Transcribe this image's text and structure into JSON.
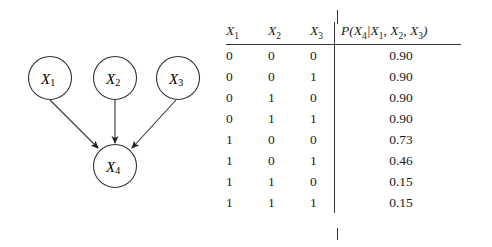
{
  "graph": {
    "nodes": [
      {
        "id": "X1",
        "var": "X",
        "sub": "1",
        "cx": 50,
        "cy": 78
      },
      {
        "id": "X2",
        "var": "X",
        "sub": "2",
        "cx": 115,
        "cy": 78
      },
      {
        "id": "X3",
        "var": "X",
        "sub": "3",
        "cx": 178,
        "cy": 78
      },
      {
        "id": "X4",
        "var": "X",
        "sub": "4",
        "cx": 115,
        "cy": 166
      }
    ],
    "edges": [
      [
        "X1",
        "X4"
      ],
      [
        "X2",
        "X4"
      ],
      [
        "X3",
        "X4"
      ]
    ]
  },
  "table": {
    "headers": [
      {
        "var": "X",
        "sub": "1"
      },
      {
        "var": "X",
        "sub": "2"
      },
      {
        "var": "X",
        "sub": "3"
      }
    ],
    "prob_header": {
      "prefix": "P(X",
      "s4": "4",
      "bar": "|X",
      "s1": "1",
      "c1": ", X",
      "s2": "2",
      "c2": ", X",
      "s3": "3",
      "suffix": ")"
    },
    "rows": [
      [
        "0",
        "0",
        "0",
        "0.90"
      ],
      [
        "0",
        "0",
        "1",
        "0.90"
      ],
      [
        "0",
        "1",
        "0",
        "0.90"
      ],
      [
        "0",
        "1",
        "1",
        "0.90"
      ],
      [
        "1",
        "0",
        "0",
        "0.73"
      ],
      [
        "1",
        "0",
        "1",
        "0.46"
      ],
      [
        "1",
        "1",
        "0",
        "0.15"
      ],
      [
        "1",
        "1",
        "1",
        "0.15"
      ]
    ]
  }
}
